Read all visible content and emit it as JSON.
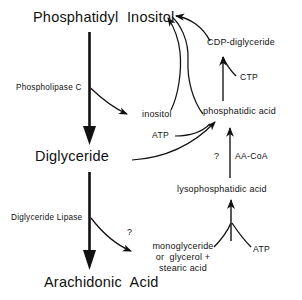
{
  "diagram": {
    "title_node": "Phosphatidyl  Inositol",
    "nodes": {
      "phosphatidyl_inositol": "Phosphatidyl  Inositol",
      "diglyceride": "Diglyceride",
      "arachidonic_acid": "Arachidonic  Acid"
    },
    "enzymes": {
      "phospholipase_c": "Phospholipase C",
      "diglyceride_lipase": "Diglyceride Lipase"
    },
    "metabolites": {
      "cdp_diglyceride": "CDP-diglyceride",
      "inositol": "inositol",
      "phosphatidic_acid": "phosphatidic acid",
      "lysophosphatidic_acid": "lysophosphatidic acid",
      "monoglyceride_line1": "monoglyceride",
      "monoglyceride_line2": "or  glycerol +",
      "monoglyceride_line3": "stearic acid"
    },
    "cofactors": {
      "ctp": "CTP",
      "atp_upper": "ATP",
      "aa_coa": "AA-CoA",
      "atp_lower": "ATP"
    },
    "unknown_steps": {
      "q_upper": "?",
      "q_middle": "?",
      "q_lower": "?"
    },
    "colors": {
      "ink": "#111111",
      "background": "#ffffff"
    }
  }
}
